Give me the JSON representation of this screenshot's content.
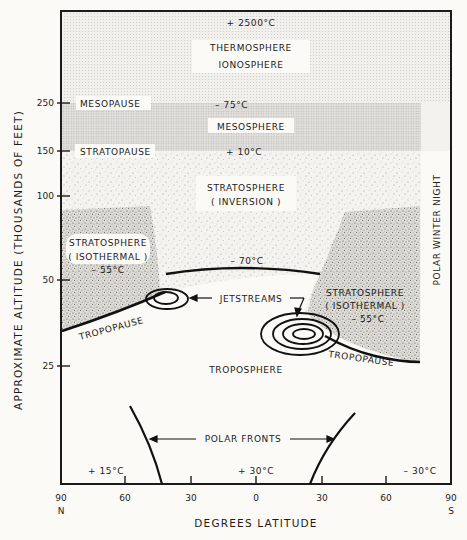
{
  "figure": {
    "y_axis_title": "APPROXIMATE ALTITUDE (THOUSANDS OF FEET)",
    "x_axis_title": "DEGREES LATITUDE",
    "side_label": "POLAR WINTER NIGHT",
    "y_ticks": [
      {
        "label": "250",
        "y": 103
      },
      {
        "label": "150",
        "y": 151
      },
      {
        "label": "100",
        "y": 196
      },
      {
        "label": "50",
        "y": 280
      },
      {
        "label": "25",
        "y": 366
      }
    ],
    "x_ticks": [
      {
        "label": "90",
        "sub": "N",
        "x": 61
      },
      {
        "label": "60",
        "sub": "",
        "x": 125
      },
      {
        "label": "30",
        "sub": "",
        "x": 191
      },
      {
        "label": "0",
        "sub": "",
        "x": 256
      },
      {
        "label": "30",
        "sub": "",
        "x": 322
      },
      {
        "label": "60",
        "sub": "",
        "x": 386
      },
      {
        "label": "90",
        "sub": "S",
        "x": 451
      }
    ],
    "layers": {
      "thermosphere_temp": "+ 2500°C",
      "thermosphere": "THERMOSPHERE",
      "ionosphere": "IONOSPHERE",
      "mesopause": "MESOPAUSE",
      "mesopause_temp": "– 75°C",
      "mesosphere": "MESOSPHERE",
      "stratopause": "STRATOPAUSE",
      "stratopause_temp": "+ 10°C",
      "stratosphere_inversion_1": "STRATOSPHERE",
      "stratosphere_inversion_2": "( INVERSION )",
      "strat_iso_left_1": "STRATOSPHERE",
      "strat_iso_left_2": "( ISOTHERMAL )",
      "strat_iso_left_temp": "– 55°C",
      "tropopause_equator_temp": "– 70°C",
      "jetstreams": "JETSTREAMS",
      "strat_iso_right_1": "STRATOSPHERE",
      "strat_iso_right_2": "( ISOTHERMAL )",
      "strat_iso_right_temp": "– 55°C",
      "tropopause_left": "TROPOPAUSE",
      "tropopause_right": "TROPOPAUSE",
      "troposphere": "TROPOSPHERE",
      "polar_fronts": "POLAR FRONTS",
      "surface_temp_north": "+ 15°C",
      "surface_temp_equator": "+ 30°C",
      "surface_temp_south": "– 30°C"
    },
    "colors": {
      "ink": "#1b1b1b",
      "paper": "#fbfaf6",
      "thermo_fill": "#ececea",
      "meso_fill": "#dcdcd8",
      "strat_fill": "#e7e6e1",
      "iso_fill": "#cfcec8"
    }
  }
}
